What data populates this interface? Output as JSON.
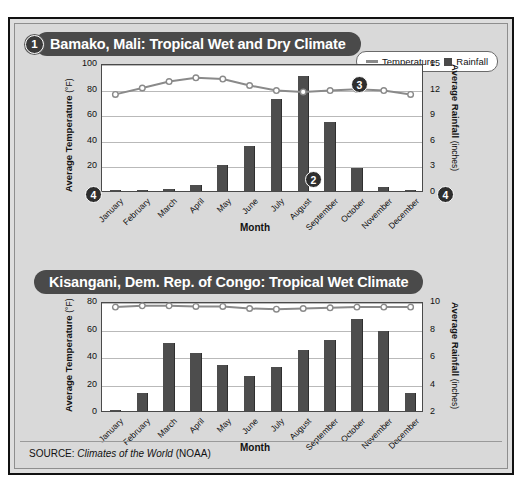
{
  "source_note": {
    "prefix": "SOURCE:",
    "title": "Climates of the World",
    "suffix": "(NOAA)"
  },
  "legend": {
    "temperature_label": "Temperature",
    "rainfall_label": "Rainfall",
    "line_color": "#8a8a8a",
    "bar_color": "#4a4a4a"
  },
  "callouts": {
    "one": "1",
    "two": "2",
    "three": "3",
    "four_left": "4",
    "four_right": "4"
  },
  "charts": [
    {
      "title": "Bamako, Mali: Tropical Wet and Dry Climate",
      "callout": "1"
    },
    {
      "title": "Kisangani, Dem. Rep. of Congo: Tropical Wet Climate",
      "callout": ""
    }
  ],
  "chart_data": [
    {
      "type": "bar",
      "title": "Bamako, Mali: Tropical Wet and Dry Climate",
      "xlabel": "Month",
      "categories": [
        "January",
        "February",
        "March",
        "April",
        "May",
        "June",
        "July",
        "August",
        "September",
        "October",
        "November",
        "December"
      ],
      "y_left": {
        "label": "Average Temperature",
        "unit": "(°F)",
        "ticks": [
          0,
          20,
          40,
          60,
          80,
          100
        ],
        "ylim": [
          0,
          100
        ]
      },
      "y_right": {
        "label": "Average Rainfall",
        "unit": "(inches)",
        "ticks": [
          0,
          3,
          6,
          9,
          12,
          15
        ],
        "ylim": [
          0,
          15
        ]
      },
      "grid": true,
      "legend_position": "top-right",
      "series": [
        {
          "name": "Rainfall",
          "kind": "bar",
          "axis": "right",
          "unit": "inches",
          "values": [
            0.1,
            0.1,
            0.2,
            0.7,
            3.0,
            5.3,
            10.8,
            13.5,
            8.1,
            2.7,
            0.5,
            0.1
          ]
        },
        {
          "name": "Temperature",
          "kind": "line",
          "axis": "left",
          "unit": "°F",
          "values": [
            77,
            82,
            87,
            90,
            89,
            84,
            80,
            79,
            80,
            81,
            80,
            77
          ]
        }
      ]
    },
    {
      "type": "bar",
      "title": "Kisangani, Dem. Rep. of Congo: Tropical Wet Climate",
      "xlabel": "Month",
      "categories": [
        "January",
        "February",
        "March",
        "April",
        "May",
        "June",
        "July",
        "August",
        "September",
        "October",
        "November",
        "December"
      ],
      "y_left": {
        "label": "Average Temperature",
        "unit": "(°F)",
        "ticks": [
          0,
          20,
          40,
          60,
          80
        ],
        "ylim": [
          0,
          80
        ]
      },
      "y_right": {
        "label": "Average Rainfall",
        "unit": "(inches)",
        "ticks": [
          2,
          4,
          6,
          8,
          10
        ],
        "ylim": [
          2,
          10
        ]
      },
      "grid": true,
      "legend_position": "none",
      "series": [
        {
          "name": "Rainfall",
          "kind": "bar",
          "axis": "left_scaled",
          "unit": "inches",
          "values": [
            0.4,
            12.8,
            49.5,
            42.0,
            33.8,
            25.3,
            31.8,
            44.7,
            51.5,
            66.7,
            58.5,
            12.8
          ]
        },
        {
          "name": "Temperature",
          "kind": "line",
          "axis": "left",
          "unit": "°F",
          "values": [
            77,
            78,
            78,
            77.5,
            77.5,
            76,
            75.5,
            76,
            76.5,
            77,
            77,
            77
          ]
        }
      ]
    }
  ]
}
